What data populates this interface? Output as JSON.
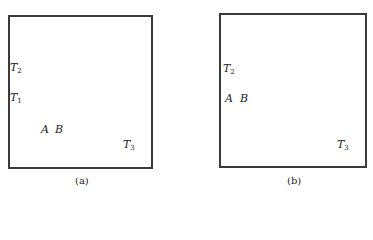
{
  "figure": {
    "panels": [
      {
        "id": "a",
        "caption": "(a)",
        "labels": [
          {
            "name": "T",
            "sub": "2"
          },
          {
            "name": "T",
            "sub": "1"
          },
          {
            "name": "A",
            "sub": ""
          },
          {
            "name": "B",
            "sub": ""
          },
          {
            "name": "T",
            "sub": "3"
          }
        ]
      },
      {
        "id": "b",
        "caption": "(b)",
        "labels": [
          {
            "name": "T",
            "sub": "2"
          },
          {
            "name": "A",
            "sub": ""
          },
          {
            "name": "B",
            "sub": ""
          },
          {
            "name": "T",
            "sub": "3"
          }
        ]
      }
    ]
  }
}
